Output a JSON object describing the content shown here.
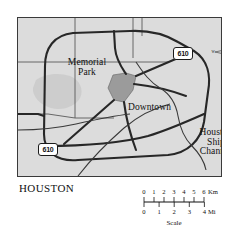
{
  "map": {
    "city_label": "HOUSTON",
    "background_color": "#dcdcdc",
    "border_color": "#3a3a3a",
    "features": [
      {
        "name": "Memorial Park",
        "label": "Memorial\nPark",
        "type": "park",
        "fill": "#cfcfcf"
      },
      {
        "name": "Downtown",
        "label": "Downtown",
        "type": "district",
        "fill": "#9a9a9a"
      },
      {
        "name": "Houston Ship Channel",
        "label": "Houston\nShip\nChannel",
        "type": "waterway"
      }
    ],
    "labels": {
      "memorial_park_line1": "Memorial",
      "memorial_park_line2": "Park",
      "downtown": "Downtown",
      "ship_channel_line1": "Houston",
      "ship_channel_line2": "Ship",
      "ship_channel_line3": "Channel"
    },
    "highway_shields": [
      {
        "id": "shield-top",
        "number": "610",
        "type": "interstate-loop"
      },
      {
        "id": "shield-left",
        "number": "610",
        "type": "interstate-loop"
      }
    ],
    "road_color": "#2b2b2b",
    "minor_road_color": "#4a4a4a"
  },
  "compass": {
    "icon": "compass-rose-icon",
    "north": "N",
    "east": "E",
    "south": "S",
    "west": "W"
  },
  "scale": {
    "caption": "Scale",
    "km": {
      "unit": "Km",
      "ticks": [
        "0",
        "1",
        "2",
        "3",
        "4",
        "5",
        "6"
      ]
    },
    "mi": {
      "unit": "Mi",
      "ticks": [
        "0",
        "1",
        "2",
        "3",
        "4"
      ]
    }
  }
}
